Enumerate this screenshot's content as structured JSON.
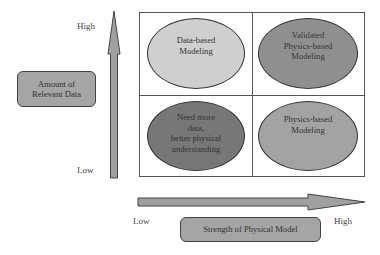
{
  "y_axis": {
    "high_label": "High",
    "low_label": "Low",
    "title": "Amount of\nRelevant Data"
  },
  "x_axis": {
    "low_label": "Low",
    "high_label": "High",
    "title": "Strength of Physical Model"
  },
  "quadrants": {
    "top_left": {
      "text": "Data-based\nModeling",
      "color": "#cfcfcf"
    },
    "top_right": {
      "text": "Validated\nPhysics-based\nModeling",
      "color": "#8f8f8f"
    },
    "bottom_left": {
      "text": "Need more\ndata,\nbetter physical\nunderstanding",
      "color": "#777777"
    },
    "bottom_right": {
      "text": "Physics-based\nModeling",
      "color": "#a3a3a3"
    }
  },
  "colors": {
    "arrow_fill": "#a0a0a0",
    "box_fill": "#a5a5a5",
    "border": "#555555"
  }
}
